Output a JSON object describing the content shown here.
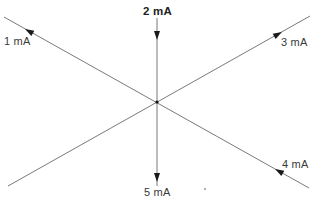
{
  "diagram": {
    "junction": {
      "x": 157,
      "y": 102
    },
    "branches": [
      {
        "id": "b1",
        "label": "1 mA",
        "current_mA": 1,
        "direction": "out",
        "end": {
          "x": 4,
          "y": 17
        }
      },
      {
        "id": "b2",
        "label": "2 mA",
        "current_mA": 2,
        "direction": "in",
        "end": {
          "x": 157,
          "y": 18
        }
      },
      {
        "id": "b3",
        "label": "3 mA",
        "current_mA": 3,
        "direction": "out",
        "end": {
          "x": 310,
          "y": 16
        }
      },
      {
        "id": "b4",
        "label": "4 mA",
        "current_mA": 4,
        "direction": "in",
        "end": {
          "x": 309,
          "y": 188
        }
      },
      {
        "id": "b5",
        "label": "5 mA",
        "current_mA": 5,
        "direction": "out",
        "end": {
          "x": 157,
          "y": 186
        }
      },
      {
        "id": "b6",
        "label": "",
        "current_mA": null,
        "direction": "",
        "end": {
          "x": 8,
          "y": 186
        }
      }
    ],
    "colors": {
      "wire": "#7a7a7a",
      "arrow": "#1a1a1a",
      "text": "#3a3a3a"
    }
  }
}
